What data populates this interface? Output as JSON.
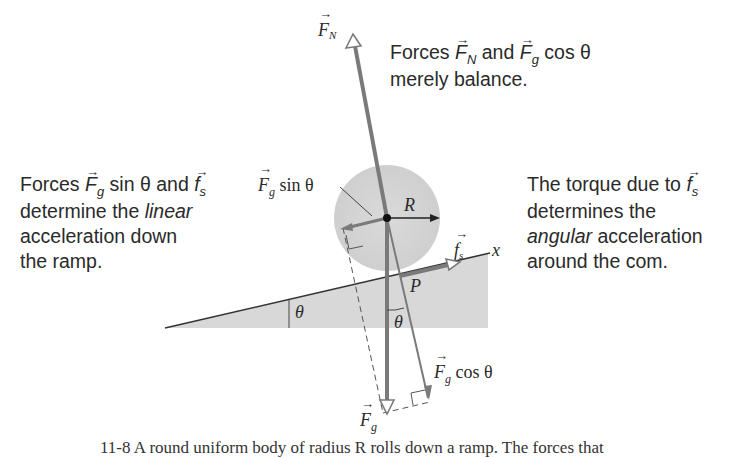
{
  "diagram": {
    "colors": {
      "vector": "#7a7a7a",
      "ramp_fill": "#d6d6d6",
      "body_fill": "#dcdcdc",
      "ink": "#2a2a2a"
    },
    "annotations": {
      "top_right": {
        "prefix": "Forces",
        "v1": "F",
        "v1_sub": "N",
        "mid": "and",
        "v2": "F",
        "v2_sub": "g",
        "suffix": "cos θ",
        "line2": "merely balance."
      },
      "left": {
        "prefix": "Forces",
        "v1": "F",
        "v1_sub": "g",
        "mid1": "sin θ and",
        "v2": "f",
        "v2_sub": "s",
        "line2_a": "determine the",
        "line2_b": "linear",
        "line3": "acceleration down",
        "line4": "the ramp."
      },
      "right": {
        "line1": "The torque due to",
        "v1": "f",
        "v1_sub": "s",
        "line2": "determines the",
        "line3_a": "angular",
        "line3_b": "acceleration",
        "line4": "around the com."
      }
    },
    "labels": {
      "FN": {
        "sym": "F",
        "sub": "N"
      },
      "Fg_sin": {
        "sym": "F",
        "sub": "g",
        "text": "sin θ"
      },
      "R": "R",
      "fs": {
        "sym": "f",
        "sub": "s"
      },
      "x_axis": "x",
      "P": "P",
      "theta_ramp": "θ",
      "theta_vec": "θ",
      "Fg_cos": {
        "sym": "F",
        "sub": "g",
        "text": "cos  θ"
      },
      "Fg": {
        "sym": "F",
        "sub": "g"
      }
    },
    "caption": "11-8  A round uniform body of radius R rolls down a ramp. The forces that"
  }
}
